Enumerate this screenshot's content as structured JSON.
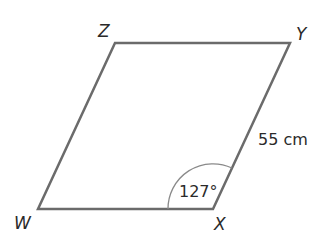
{
  "diagram": {
    "type": "parallelogram",
    "vertices": {
      "W": {
        "label": "W",
        "x": 38,
        "y": 209
      },
      "X": {
        "label": "X",
        "x": 213,
        "y": 209
      },
      "Y": {
        "label": "Y",
        "x": 290,
        "y": 43
      },
      "Z": {
        "label": "Z",
        "x": 115,
        "y": 43
      }
    },
    "side_label": "55 cm",
    "angle_label": "127°",
    "colors": {
      "edge": "#6b6b6b",
      "arc": "#8a8a8a",
      "text": "#2a2a2a",
      "background": "#ffffff"
    }
  }
}
